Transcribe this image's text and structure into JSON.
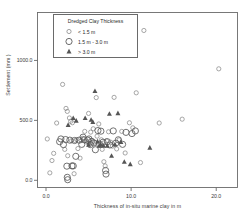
{
  "chart_data": {
    "type": "scatter",
    "title": "",
    "xlabel": "Thickness of in-situ marine clay in m",
    "ylabel": "Settlement (mm )",
    "xlim": [
      -1.0,
      22.5
    ],
    "ylim": [
      -60.0,
      1400.0
    ],
    "xticks": [
      0.0,
      10.0,
      20.0
    ],
    "xticklabels": [
      "0.0",
      "10.0",
      "20.0"
    ],
    "yticks": [
      0.0,
      500.0,
      1000.0
    ],
    "yticklabels": [
      "0.0",
      "500.0",
      "1000.0"
    ],
    "grid": false,
    "legend": {
      "title": "Dredged Clay Thickness",
      "position": "upper-left",
      "entries": [
        {
          "label": "< 1.5 m",
          "marker": "small-circle"
        },
        {
          "label": "1.5 m - 3.0 m",
          "marker": "large-circle"
        },
        {
          "label": "> 3.0 m",
          "marker": "filled-triangle"
        }
      ]
    },
    "series": [
      {
        "name": "< 1.5 m",
        "marker": "small-circle",
        "points": [
          [
            0.15,
            345
          ],
          [
            0.45,
            62
          ],
          [
            0.7,
            165
          ],
          [
            0.9,
            225
          ],
          [
            1.25,
            478
          ],
          [
            1.95,
            800
          ],
          [
            2.2,
            258
          ],
          [
            2.35,
            600
          ],
          [
            2.5,
            575
          ],
          [
            2.55,
            205
          ],
          [
            2.75,
            520
          ],
          [
            2.9,
            492
          ],
          [
            3.0,
            330
          ],
          [
            3.1,
            480
          ],
          [
            3.3,
            55
          ],
          [
            3.45,
            330
          ],
          [
            3.6,
            340
          ],
          [
            3.75,
            265
          ],
          [
            4.0,
            185
          ],
          [
            4.15,
            332
          ],
          [
            4.3,
            350
          ],
          [
            4.55,
            408
          ],
          [
            4.8,
            322
          ],
          [
            5.0,
            558
          ],
          [
            5.1,
            300
          ],
          [
            5.25,
            402
          ],
          [
            5.4,
            332
          ],
          [
            5.55,
            430
          ],
          [
            5.7,
            318
          ],
          [
            5.9,
            690
          ],
          [
            6.0,
            368
          ],
          [
            6.2,
            470
          ],
          [
            6.35,
            300
          ],
          [
            6.5,
            338
          ],
          [
            6.6,
            258
          ],
          [
            6.8,
            155
          ],
          [
            6.95,
            120
          ],
          [
            7.1,
            330
          ],
          [
            7.35,
            405
          ],
          [
            7.6,
            318
          ],
          [
            7.8,
            285
          ],
          [
            8.0,
            692
          ],
          [
            8.3,
            262
          ],
          [
            8.6,
            338
          ],
          [
            8.9,
            408
          ],
          [
            9.3,
            228
          ],
          [
            9.8,
            480
          ],
          [
            10.2,
            438
          ],
          [
            10.6,
            730
          ],
          [
            11.1,
            148
          ],
          [
            11.5,
            1250
          ],
          [
            13.3,
            478
          ],
          [
            16.0,
            510
          ],
          [
            20.3,
            930
          ]
        ]
      },
      {
        "name": "1.5 m - 3.0 m",
        "marker": "large-circle",
        "points": [
          [
            1.6,
            322
          ],
          [
            1.75,
            345
          ],
          [
            2.05,
            298
          ],
          [
            2.3,
            340
          ],
          [
            2.45,
            118
          ],
          [
            2.5,
            25
          ],
          [
            2.55,
            5
          ],
          [
            2.8,
            335
          ],
          [
            3.05,
            120
          ],
          [
            3.2,
            120
          ],
          [
            3.35,
            332
          ],
          [
            3.5,
            200
          ],
          [
            3.9,
            335
          ],
          [
            4.2,
            300
          ],
          [
            4.35,
            360
          ],
          [
            4.5,
            338
          ],
          [
            4.9,
            335
          ],
          [
            5.05,
            345
          ],
          [
            5.2,
            298
          ],
          [
            5.35,
            325
          ],
          [
            5.6,
            312
          ],
          [
            5.8,
            255
          ],
          [
            6.1,
            415
          ],
          [
            6.3,
            300
          ],
          [
            6.45,
            410
          ],
          [
            6.7,
            318
          ],
          [
            7.0,
            82
          ],
          [
            7.05,
            52
          ],
          [
            7.2,
            322
          ],
          [
            7.5,
            295
          ],
          [
            7.9,
            412
          ],
          [
            8.2,
            310
          ],
          [
            8.5,
            338
          ],
          [
            9.0,
            300
          ],
          [
            9.4,
            400
          ],
          [
            10.1,
            390
          ],
          [
            10.5,
            412
          ]
        ]
      },
      {
        "name": "> 3.0 m",
        "marker": "filled-triangle",
        "points": [
          [
            2.6,
            462
          ],
          [
            3.2,
            520
          ],
          [
            3.55,
            498
          ],
          [
            4.6,
            520
          ],
          [
            5.0,
            298
          ],
          [
            5.3,
            505
          ],
          [
            5.5,
            488
          ],
          [
            5.75,
            745
          ],
          [
            6.05,
            325
          ],
          [
            6.25,
            288
          ],
          [
            6.4,
            300
          ],
          [
            6.75,
            290
          ],
          [
            7.2,
            290
          ],
          [
            7.45,
            555
          ],
          [
            7.7,
            205
          ],
          [
            8.1,
            300
          ],
          [
            8.45,
            560
          ],
          [
            8.8,
            320
          ],
          [
            9.2,
            155
          ],
          [
            9.9,
            135
          ],
          [
            12.2,
            272
          ]
        ]
      }
    ]
  },
  "axes": {
    "xtick_0": "0.0",
    "xtick_1": "10.0",
    "xtick_2": "20.0",
    "ytick_0": "0.0",
    "ytick_1": "500.0",
    "ytick_2": "1000.0",
    "xlabel": "Thickness of in-situ marine clay in m",
    "ylabel": "Settlement (mm )"
  },
  "legend": {
    "title": "Dredged Clay Thickness",
    "entry_0": "< 1.5 m",
    "entry_1": "1.5 m - 3.0 m",
    "entry_2": "> 3.0 m"
  },
  "colors": {
    "frame": "#6a6a6a",
    "marker_small": "#8a8a8a",
    "marker_large": "#5a5a5a",
    "marker_triangle": "#555555",
    "text": "#2b2b2b"
  }
}
